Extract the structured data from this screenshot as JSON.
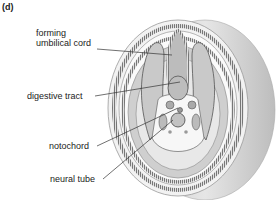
{
  "figure": {
    "panel_label": "(d)",
    "labels": [
      {
        "id": "umbilical",
        "line1": "forming",
        "line2": "umbilical cord"
      },
      {
        "id": "digestive",
        "text": "digestive tract"
      },
      {
        "id": "notochord",
        "text": "notochord"
      },
      {
        "id": "neural",
        "text": "neural tube"
      }
    ]
  },
  "colors": {
    "outer_fill": "#d8d8d8",
    "inner_fill": "#c4c4c4",
    "ring_stripe": "#6a6a6a",
    "leader_line": "#333333"
  }
}
